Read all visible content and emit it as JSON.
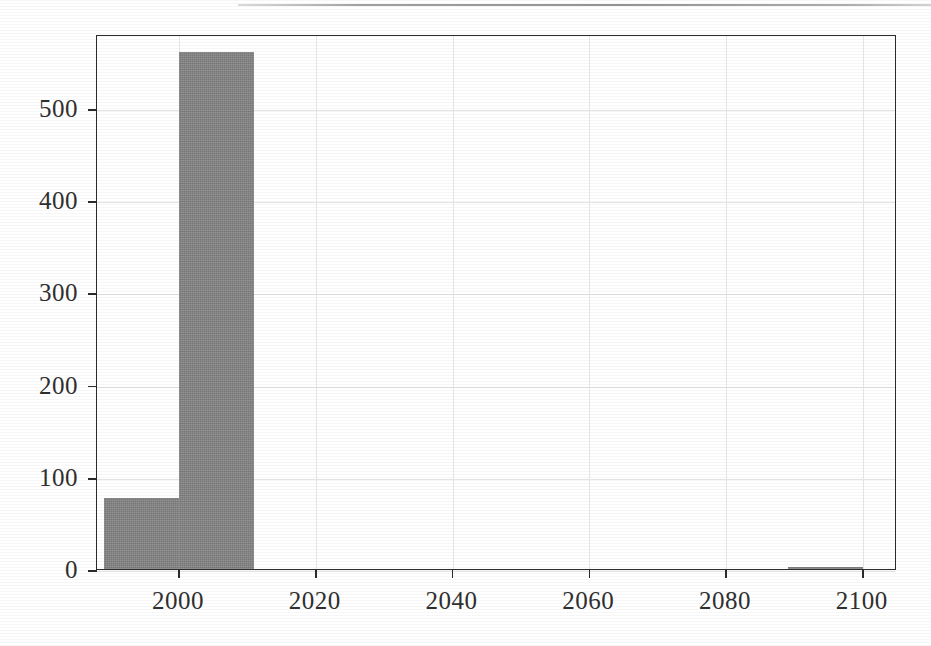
{
  "figure": {
    "has_top_rule": true,
    "background_color": "#ffffff",
    "frame_color": "#2b2b2b",
    "grid_color": "#e2e2e2"
  },
  "chart_data": {
    "type": "bar",
    "subtype": "histogram",
    "title": "",
    "xlabel": "",
    "ylabel": "",
    "xlim": [
      1988,
      2105
    ],
    "ylim": [
      0,
      580
    ],
    "grid": true,
    "legend": "none",
    "bar_color": "#858585",
    "bin_width": 11,
    "bins": [
      {
        "left": 1989,
        "right": 2000,
        "value": 77
      },
      {
        "left": 2000,
        "right": 2011,
        "value": 561
      },
      {
        "left": 2089,
        "right": 2100,
        "value": 2
      }
    ],
    "x": [
      1994.5,
      2005.5,
      2094.5
    ],
    "values": [
      77,
      561,
      2
    ],
    "xticks": [
      2000,
      2020,
      2040,
      2060,
      2080,
      2100
    ],
    "xticklabels": [
      "2000",
      "2020",
      "2040",
      "2060",
      "2080",
      "2100"
    ],
    "yticks": [
      0,
      100,
      200,
      300,
      400,
      500
    ],
    "yticklabels": [
      "0",
      "100",
      "200",
      "300",
      "400",
      "500"
    ]
  }
}
